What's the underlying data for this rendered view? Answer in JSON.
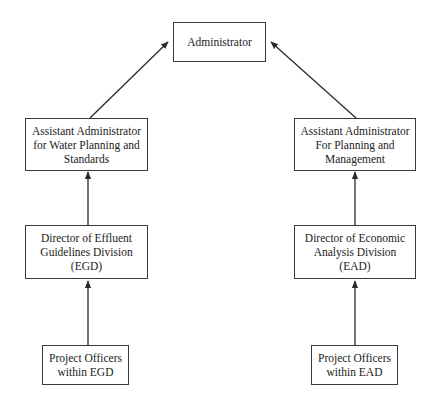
{
  "diagram": {
    "type": "org-chart",
    "colors": {
      "line": "#2a2a2a",
      "border": "#3a3a3a",
      "text": "#222222",
      "background": "#ffffff"
    },
    "nodes": {
      "administrator": {
        "lines": [
          "Administrator"
        ]
      },
      "aa_water": {
        "lines": [
          "Assistant Administrator",
          "for Water Planning and",
          "Standards"
        ]
      },
      "aa_planning": {
        "lines": [
          "Assistant Administrator",
          "For Planning and",
          "Management"
        ]
      },
      "dir_egd": {
        "lines": [
          "Director of Effluent",
          "Guidelines Division",
          "(EGD)"
        ]
      },
      "dir_ead": {
        "lines": [
          "Director of Economic",
          "Analysis Division",
          "(EAD)"
        ]
      },
      "po_egd": {
        "lines": [
          "Project Officers",
          "within EGD"
        ]
      },
      "po_ead": {
        "lines": [
          "Project Officers",
          "within EAD"
        ]
      }
    },
    "edges": [
      {
        "from": "aa_water",
        "to": "administrator"
      },
      {
        "from": "aa_planning",
        "to": "administrator"
      },
      {
        "from": "dir_egd",
        "to": "aa_water"
      },
      {
        "from": "dir_ead",
        "to": "aa_planning"
      },
      {
        "from": "po_egd",
        "to": "dir_egd"
      },
      {
        "from": "po_ead",
        "to": "dir_ead"
      }
    ]
  }
}
